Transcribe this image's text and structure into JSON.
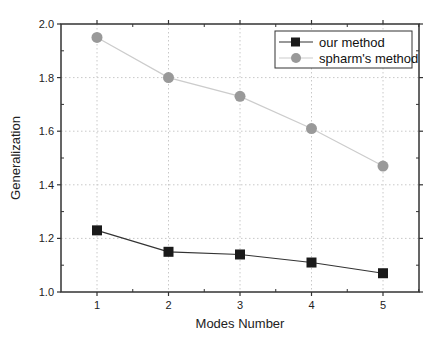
{
  "chart_data": {
    "type": "line",
    "title": "",
    "xlabel": "Modes Number",
    "ylabel": "Generalization",
    "x": [
      1,
      2,
      3,
      4,
      5
    ],
    "xlim": [
      0.5,
      5.5
    ],
    "ylim": [
      1.0,
      2.0
    ],
    "xticks": [
      "1",
      "2",
      "3",
      "4",
      "5"
    ],
    "yticks": [
      "1.0",
      "1.2",
      "1.4",
      "1.6",
      "1.8",
      "2.0"
    ],
    "grid": true,
    "legend_position": "upper right",
    "series": [
      {
        "name": "our method",
        "marker": "square",
        "color": "#1a1a1a",
        "line_color": "#333333",
        "values": [
          1.23,
          1.15,
          1.14,
          1.11,
          1.07
        ]
      },
      {
        "name": "spharm's method",
        "marker": "circle",
        "color": "#999999",
        "line_color": "#cccccc",
        "values": [
          1.95,
          1.8,
          1.73,
          1.61,
          1.47
        ]
      }
    ]
  }
}
